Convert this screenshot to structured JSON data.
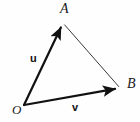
{
  "figure": {
    "background_color": "#fefefe",
    "stroke_color": "#111111",
    "thin_stroke_color": "#3a3a3a",
    "width": 140,
    "height": 122
  },
  "points": [
    {
      "id": "O",
      "label": "O",
      "x": 24,
      "y": 105
    },
    {
      "id": "A",
      "label": "A",
      "x": 63,
      "y": 23
    },
    {
      "id": "B",
      "label": "B",
      "x": 120,
      "y": 88
    }
  ],
  "vectors": [
    {
      "id": "u",
      "label": "u",
      "from": "O",
      "to": "A",
      "arrow": true,
      "stroke_width": 2.2,
      "color": "#111111"
    },
    {
      "id": "v",
      "label": "v",
      "from": "O",
      "to": "B",
      "arrow": true,
      "stroke_width": 2.2,
      "color": "#111111"
    }
  ],
  "segments": [
    {
      "id": "AB",
      "from": "A",
      "to": "B",
      "arrow": false,
      "stroke_width": 1,
      "color": "#3a3a3a"
    }
  ],
  "labels": {
    "point_A": "A",
    "point_B": "B",
    "point_O": "O",
    "vector_u": "u",
    "vector_v": "v"
  }
}
